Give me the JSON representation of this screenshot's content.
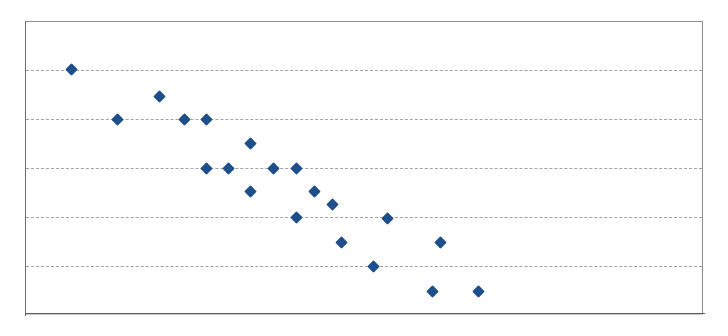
{
  "figure": {
    "background_color": "#ffffff",
    "frame_color": "#8d8d8d",
    "marker_color": "#1f4e8c",
    "gridline_color": "#9b9b9b",
    "plot_left": 25,
    "plot_top": 21,
    "plot_width": 678,
    "plot_height": 293
  },
  "chart_data": {
    "type": "scatter",
    "title": "",
    "subtitle": "",
    "xlabel": "",
    "ylabel": "",
    "legend": [],
    "legend_position": "none",
    "grid": true,
    "grid_axis": "y",
    "gridline_y_pixels": [
      69,
      118,
      167,
      216,
      265
    ],
    "gridline_count": 5,
    "xlim": [
      25,
      703
    ],
    "ylim": [
      314,
      21
    ],
    "xticklabels": [],
    "yticklabels": [],
    "marker": "diamond",
    "marker_size": 9,
    "point_count": 20,
    "series": [
      {
        "name": "series-1",
        "color": "#1f4e8c",
        "points": [
          {
            "x": 70,
            "y": 68
          },
          {
            "x": 116,
            "y": 118
          },
          {
            "x": 158,
            "y": 95
          },
          {
            "x": 183,
            "y": 118
          },
          {
            "x": 205,
            "y": 118
          },
          {
            "x": 249,
            "y": 142
          },
          {
            "x": 205,
            "y": 167
          },
          {
            "x": 227,
            "y": 167
          },
          {
            "x": 272,
            "y": 167
          },
          {
            "x": 295,
            "y": 167
          },
          {
            "x": 249,
            "y": 190
          },
          {
            "x": 313,
            "y": 190
          },
          {
            "x": 331,
            "y": 203
          },
          {
            "x": 295,
            "y": 216
          },
          {
            "x": 386,
            "y": 217
          },
          {
            "x": 340,
            "y": 241
          },
          {
            "x": 439,
            "y": 241
          },
          {
            "x": 372,
            "y": 265
          },
          {
            "x": 431,
            "y": 290
          },
          {
            "x": 477,
            "y": 290
          }
        ]
      }
    ]
  }
}
